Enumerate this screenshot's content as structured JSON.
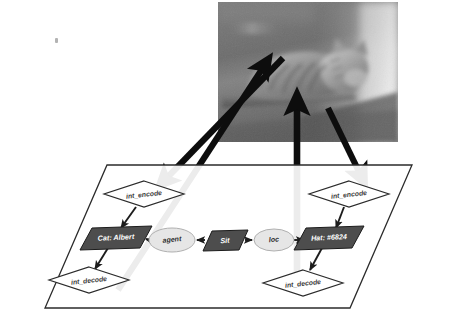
{
  "figure": {
    "photo": {
      "alt_text": "Grayscale photograph of a tabby cat lying down on a ledge",
      "subject": "cat",
      "palette": {
        "background": "#6f6f6f",
        "midtone": "#8d8d8d",
        "highlight": "#d8d8d8",
        "shadow": "#3f3f3f"
      },
      "frame": {
        "x": 218,
        "y": 2,
        "width": 180,
        "height": 140
      }
    },
    "plane": {
      "label": "scene-graph-plane",
      "stroke": "#2b2b2b",
      "fill": "#ffffff",
      "corners": [
        {
          "x": 107,
          "y": 165
        },
        {
          "x": 412,
          "y": 165
        },
        {
          "x": 350,
          "y": 308
        },
        {
          "x": 45,
          "y": 308
        }
      ]
    },
    "colors": {
      "dark_node_fill": "#4d4d4d",
      "dark_node_stroke": "#1c1c1c",
      "light_node_fill": "#e6e6e6",
      "light_node_stroke": "#9a9a9a",
      "diamond_fill": "#ffffff",
      "diamond_stroke": "#2b2b2b",
      "edge": "#1c1c1c",
      "grounding_arrow": "#0d0d0d"
    },
    "nodes": [
      {
        "id": "int-encode-left",
        "label": "int_encode",
        "shape": "diamond",
        "style": "outline",
        "cx": 144,
        "cy": 194,
        "rx": 40,
        "ry": 13
      },
      {
        "id": "cat-albert",
        "label": "Cat: Albert",
        "shape": "parallelogram",
        "style": "dark",
        "cx": 116,
        "cy": 238,
        "w": 58,
        "h": 18
      },
      {
        "id": "agent",
        "label": "agent",
        "shape": "ellipse",
        "style": "light",
        "cx": 172,
        "cy": 240,
        "rx": 23,
        "ry": 12
      },
      {
        "id": "sit",
        "label": "Sit",
        "shape": "parallelogram",
        "style": "dark",
        "cx": 225,
        "cy": 240,
        "w": 38,
        "h": 18
      },
      {
        "id": "loc",
        "label": "loc",
        "shape": "ellipse",
        "style": "light",
        "cx": 274,
        "cy": 240,
        "rx": 20,
        "ry": 11
      },
      {
        "id": "hat",
        "label": "Hat: #6824",
        "shape": "parallelogram",
        "style": "dark",
        "cx": 329,
        "cy": 238,
        "w": 58,
        "h": 18
      },
      {
        "id": "int-decode-left",
        "label": "int_decode",
        "shape": "diamond",
        "style": "outline",
        "cx": 89,
        "cy": 280,
        "rx": 40,
        "ry": 13
      },
      {
        "id": "int-encode-right",
        "label": "int_encode",
        "shape": "diamond",
        "style": "outline",
        "cx": 349,
        "cy": 194,
        "rx": 40,
        "ry": 13
      },
      {
        "id": "int-decode-right",
        "label": "int_decode",
        "shape": "diamond",
        "style": "outline",
        "cx": 303,
        "cy": 283,
        "rx": 40,
        "ry": 13
      }
    ],
    "edges": [
      {
        "id": "edge-encode-to-cat",
        "from": "int-encode-left",
        "to": "cat-albert",
        "kind": "graph"
      },
      {
        "id": "edge-cat-to-decode",
        "from": "cat-albert",
        "to": "int-decode-left",
        "kind": "graph"
      },
      {
        "id": "edge-sit-to-agent",
        "from": "sit",
        "to": "agent",
        "kind": "graph"
      },
      {
        "id": "edge-agent-to-cat",
        "from": "agent",
        "to": "cat-albert",
        "kind": "graph"
      },
      {
        "id": "edge-sit-to-loc",
        "from": "sit",
        "to": "loc",
        "kind": "graph"
      },
      {
        "id": "edge-loc-to-hat",
        "from": "loc",
        "to": "hat",
        "kind": "graph"
      },
      {
        "id": "edge-encode-right-to-hat",
        "from": "int-encode-right",
        "to": "hat",
        "kind": "graph"
      },
      {
        "id": "edge-hat-to-decode-right",
        "from": "hat",
        "to": "int-decode-right",
        "kind": "graph"
      }
    ],
    "grounding_arrows": [
      {
        "id": "ground-decode-left-up",
        "direction": "up",
        "description": "int_decode (left) to cat body in photo"
      },
      {
        "id": "ground-photo-down-left",
        "direction": "down",
        "description": "photo to int_encode (left)"
      },
      {
        "id": "ground-decode-right-up",
        "direction": "up",
        "description": "int_decode (right) to cat in photo"
      },
      {
        "id": "ground-photo-down-right",
        "direction": "down",
        "description": "photo to int_encode (right)"
      }
    ],
    "speck": {
      "x": 55,
      "y": 38
    }
  }
}
